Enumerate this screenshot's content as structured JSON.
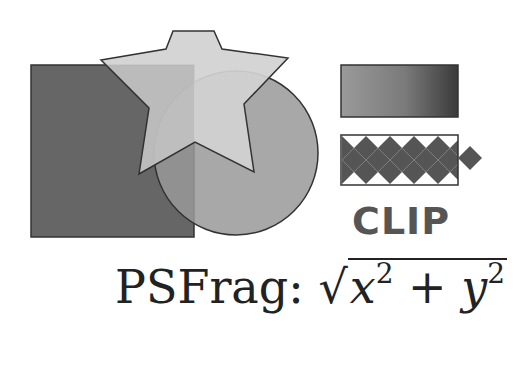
{
  "figure": {
    "shapes": {
      "square": {
        "fill": "#666666"
      },
      "circle": {
        "fill": "#999999"
      },
      "star": {
        "fill": "#cccccc"
      },
      "gradient_rect": {
        "from": "#9a9a9a",
        "to": "#3a3a3a"
      },
      "checker_rect": {
        "dark": "#555555",
        "light": "#ffffff"
      }
    },
    "clip_label": "CLIP",
    "formula": {
      "prefix": "PSFrag:",
      "sqrt_symbol": "√",
      "x": "x",
      "x_exp": "2",
      "plus": "+",
      "y": "y",
      "y_exp": "2"
    }
  }
}
